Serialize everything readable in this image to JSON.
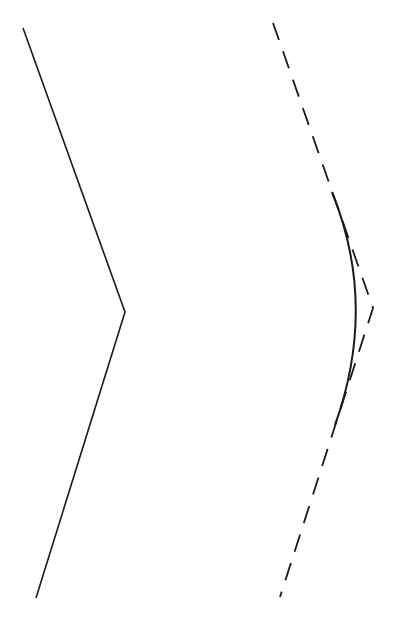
{
  "diagram": {
    "background": "#ffffff",
    "stroke_color": "#1a1a1a",
    "left_polyline": {
      "style": "solid",
      "points": [
        [
          23,
          28
        ],
        [
          125,
          312
        ],
        [
          36,
          598
        ]
      ]
    },
    "right_polyline": {
      "style": "dashed",
      "dash": "18 12",
      "points": [
        [
          273,
          23
        ],
        [
          373,
          308
        ],
        [
          280,
          597
        ]
      ]
    },
    "rounding_curve": {
      "style": "solid",
      "start": [
        332,
        192
      ],
      "control": [
        378,
        305
      ],
      "end": [
        335,
        425
      ]
    }
  }
}
